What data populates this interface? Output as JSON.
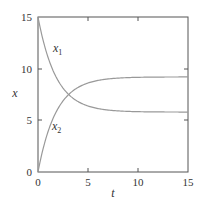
{
  "chart_data": {
    "type": "line",
    "title": "",
    "xlabel": "t",
    "ylabel": "x",
    "xlim": [
      0,
      15
    ],
    "ylim": [
      0,
      15
    ],
    "xticks": [
      "0",
      "5",
      "10",
      "15"
    ],
    "yticks": [
      "0",
      "5",
      "10",
      "15"
    ],
    "grid": false,
    "legend": "inline curve labels",
    "series": [
      {
        "name": "x1",
        "label_main": "x",
        "label_sub": "1",
        "x": [
          0,
          1,
          2,
          2.5,
          3,
          4,
          5,
          6,
          8,
          10,
          15
        ],
        "values": [
          15,
          11.5,
          9.0,
          8.0,
          7.4,
          6.6,
          6.2,
          6.0,
          5.85,
          5.8,
          5.8
        ]
      },
      {
        "name": "x2",
        "label_main": "x",
        "label_sub": "2",
        "x": [
          0,
          1,
          2,
          2.5,
          3,
          4,
          5,
          6,
          8,
          10,
          15
        ],
        "values": [
          0,
          4.0,
          6.6,
          7.4,
          7.9,
          8.6,
          8.9,
          9.05,
          9.15,
          9.2,
          9.2
        ]
      }
    ]
  }
}
